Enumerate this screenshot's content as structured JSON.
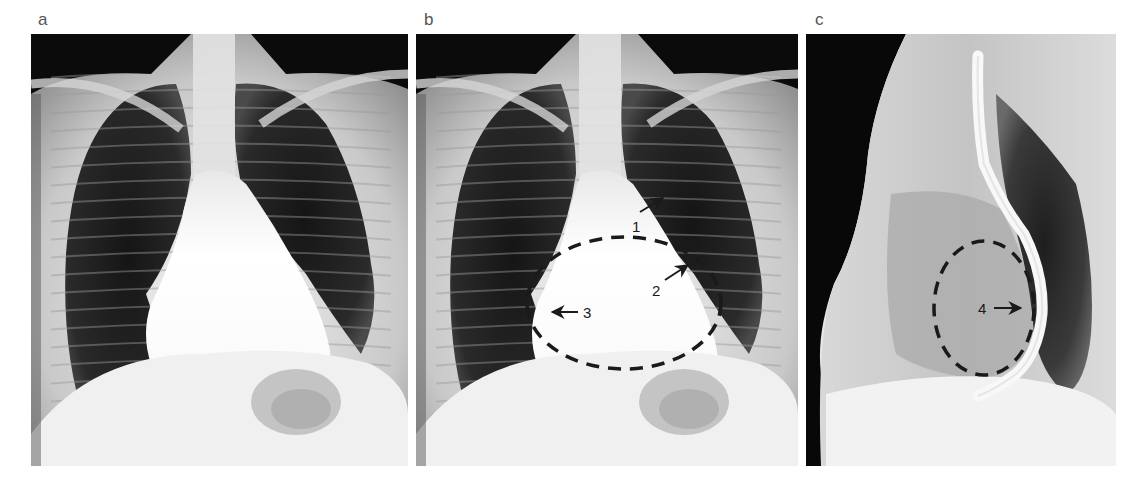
{
  "figure": {
    "panels": [
      {
        "id": "a",
        "label": "a",
        "view": "posteroanterior chest radiograph",
        "annotations": []
      },
      {
        "id": "b",
        "label": "b",
        "view": "posteroanterior chest radiograph (annotated)",
        "annotations": [
          {
            "number": "1",
            "type": "arrow",
            "direction": "up-right"
          },
          {
            "number": "2",
            "type": "arrow",
            "direction": "up-right"
          },
          {
            "number": "3",
            "type": "arrow",
            "direction": "left"
          }
        ],
        "outline": {
          "shape": "dashed-ellipse",
          "color": "#1a1a1a"
        }
      },
      {
        "id": "c",
        "label": "c",
        "view": "lateral chest radiograph with barium esophagram",
        "annotations": [
          {
            "number": "4",
            "type": "arrow",
            "direction": "right"
          }
        ],
        "outline": {
          "shape": "dashed-ellipse",
          "color": "#1a1a1a"
        }
      }
    ]
  },
  "labels": {
    "a": "a",
    "b": "b",
    "c": "c",
    "anno1": "1",
    "anno2": "2",
    "anno3": "3",
    "anno4": "4"
  }
}
